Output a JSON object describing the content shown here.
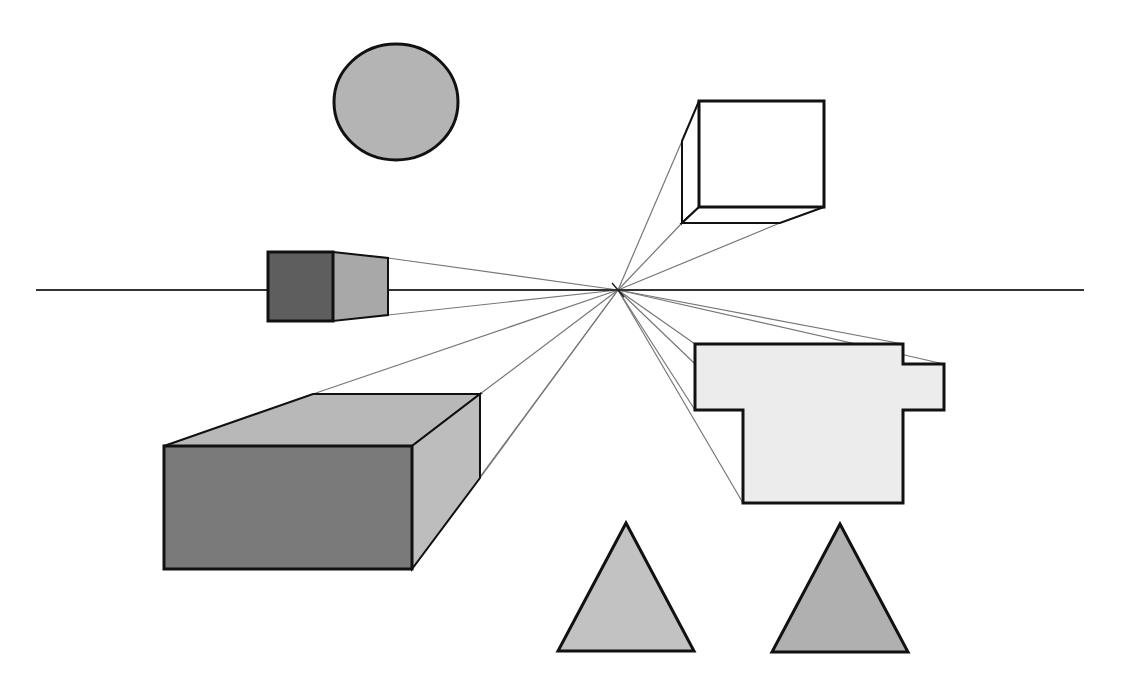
{
  "diagram": {
    "title": "One-point perspective",
    "width": 1122,
    "height": 685,
    "background": "#ffffff",
    "stroke_color": "#111111",
    "guide_color": "#777777",
    "horizon": {
      "x1": 36,
      "x2": 1084,
      "y": 290
    },
    "vanishing_point": {
      "x": 618,
      "y": 290
    },
    "shapes": [
      {
        "id": "circle",
        "kind": "ellipse",
        "cx": 396,
        "cy": 102,
        "rx": 62,
        "ry": 58,
        "fill": "#b4b4b4"
      },
      {
        "id": "small-cube",
        "kind": "polygons",
        "faces": [
          {
            "name": "side-face",
            "points": "333,252 388,258 388,315 333,321",
            "fill": "#a8a8a8"
          },
          {
            "name": "front-face",
            "points": "268,252 333,252 333,321 268,321",
            "fill": "#5e5e5e"
          }
        ]
      },
      {
        "id": "wire-cube",
        "kind": "polygons",
        "faces": [
          {
            "name": "left-face",
            "points": "682,141 699,101 699,207 682,223",
            "fill": "#ffffff"
          },
          {
            "name": "bottom-face",
            "points": "682,223 699,207 824,207 780,223",
            "fill": "#ffffff"
          },
          {
            "name": "front-face",
            "points": "699,101 824,101 824,207 699,207",
            "fill": "#ffffff"
          }
        ]
      },
      {
        "id": "big-box",
        "kind": "polygons",
        "faces": [
          {
            "name": "top-face",
            "points": "164,446 313,394 480,394 412,446",
            "fill": "#b8b8b8"
          },
          {
            "name": "side-face",
            "points": "412,446 480,394 480,478 412,569",
            "fill": "#bdbdbd"
          },
          {
            "name": "front-face",
            "points": "164,446 412,446 412,569 164,569",
            "fill": "#7a7a7a"
          }
        ]
      },
      {
        "id": "stepped-shape",
        "kind": "polygons",
        "faces": [
          {
            "name": "front-face",
            "points": "695,344 903,344 903,364 944,364 944,410 903,410 903,503 743,503 743,410 695,410",
            "fill": "#ececec"
          }
        ]
      },
      {
        "id": "triangle-left",
        "kind": "polygons",
        "faces": [
          {
            "name": "face",
            "points": "626,523 694,651 558,651",
            "fill": "#c2c2c2"
          }
        ]
      },
      {
        "id": "triangle-right",
        "kind": "polygons",
        "faces": [
          {
            "name": "face",
            "points": "840,524 908,652 772,652",
            "fill": "#b0b0b0"
          }
        ]
      }
    ],
    "guide_lines": [
      {
        "to": "388,258"
      },
      {
        "to": "388,315"
      },
      {
        "to": "682,141"
      },
      {
        "to": "682,223"
      },
      {
        "to": "780,223"
      },
      {
        "to": "313,394"
      },
      {
        "to": "480,394"
      },
      {
        "to": "480,478"
      },
      {
        "to": "412,569"
      },
      {
        "to": "695,344"
      },
      {
        "to": "903,344"
      },
      {
        "to": "944,364"
      },
      {
        "to": "743,410"
      },
      {
        "to": "743,503"
      },
      {
        "to": "695,410"
      }
    ]
  }
}
